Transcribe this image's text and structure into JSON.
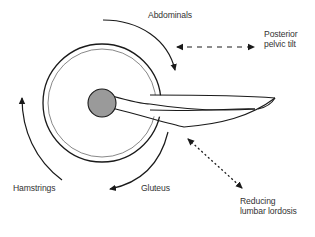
{
  "diagram": {
    "type": "biomechanics",
    "labels": {
      "abdominals": "Abdominals",
      "posterior_pelvic_tilt_line1": "Posterior",
      "posterior_pelvic_tilt_line2": "pelvic tilt",
      "hamstrings": "Hamstrings",
      "gluteus": "Gluteus",
      "reducing_lordosis_line1": "Reducing",
      "reducing_lordosis_line2": "lumbar lordosis"
    },
    "colors": {
      "stroke": "#1a1a1a",
      "hip_joint_fill": "#9a9a9a",
      "text": "#333333",
      "background": "#ffffff"
    }
  }
}
